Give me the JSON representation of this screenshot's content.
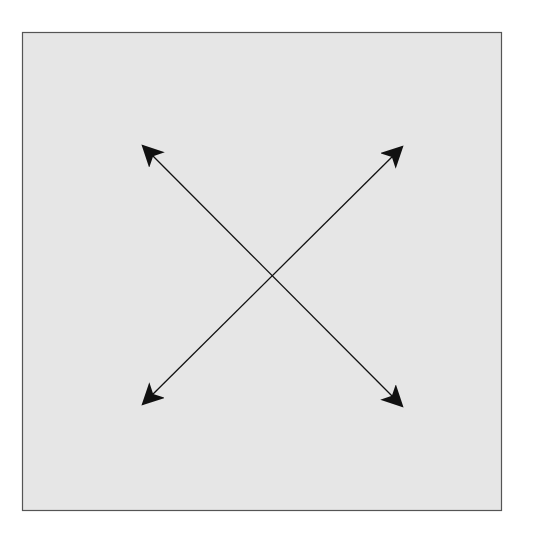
{
  "diagram": {
    "type": "crossed-double-arrows",
    "background_color": "#ffffff",
    "box": {
      "x": 22,
      "y": 32,
      "width": 479,
      "height": 478,
      "fill": "#e6e6e6",
      "stroke": "#555555"
    },
    "arrows": [
      {
        "name": "diagonal-arrow-tl-br",
        "from": [
          143,
          146
        ],
        "to": [
          402,
          406
        ],
        "double_headed": true,
        "color": "#111111"
      },
      {
        "name": "diagonal-arrow-tr-bl",
        "from": [
          402,
          147
        ],
        "to": [
          143,
          404
        ],
        "double_headed": true,
        "color": "#111111"
      }
    ],
    "intersection": [
      272,
      276
    ]
  }
}
